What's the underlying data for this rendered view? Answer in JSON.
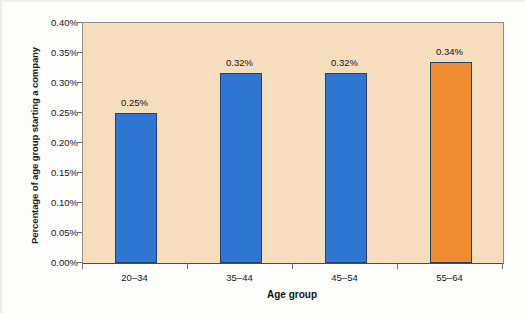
{
  "chart_data": {
    "type": "bar",
    "title": "",
    "xlabel": "Age group",
    "ylabel": "Percentage of age group starting a company",
    "categories": [
      "20–34",
      "35–44",
      "45–54",
      "55–64"
    ],
    "values": [
      0.25,
      0.3167,
      0.3175,
      0.335
    ],
    "data_labels": [
      "0.25%",
      "0.32%",
      "0.32%",
      "0.34%"
    ],
    "bar_colors": [
      "#2f76d2",
      "#2f76d2",
      "#2f76d2",
      "#ef8b33"
    ],
    "bar_border_color": "#23406e",
    "highlight_index": 3,
    "ylim": [
      0,
      0.4
    ],
    "ytick_values": [
      0.0,
      0.05,
      0.1,
      0.15,
      0.2,
      0.25,
      0.3,
      0.35,
      0.4
    ],
    "ytick_labels": [
      "0.00%",
      "0.05%",
      "0.10%",
      "0.15%",
      "0.20%",
      "0.25%",
      "0.30%",
      "0.35%",
      "0.40%"
    ],
    "grid": false,
    "legend": "none",
    "plot_background": "#f6ddbe",
    "figure_background": "#fdfdfc",
    "axis_color": "#6b6b6b"
  }
}
